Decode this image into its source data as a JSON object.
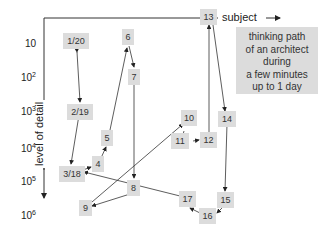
{
  "axes": {
    "x_label": "subject",
    "y_label": "level of detail",
    "y_ticks": [
      {
        "base": "10",
        "exp": ""
      },
      {
        "base": "10",
        "exp": "2"
      },
      {
        "base": "10",
        "exp": "3"
      },
      {
        "base": "10",
        "exp": "4"
      },
      {
        "base": "10",
        "exp": "5"
      },
      {
        "base": "10",
        "exp": "6"
      }
    ]
  },
  "note": {
    "line1": "thinking path",
    "line2": "of an architect",
    "line3": "during",
    "line4": "a few minutes",
    "line5": "up to 1 day"
  },
  "nodes": {
    "n1_20": "1/20",
    "n2_19": "2/19",
    "n3_18": "3/18",
    "n4": "4",
    "n5": "5",
    "n6": "6",
    "n7": "7",
    "n8": "8",
    "n9": "9",
    "n10": "10",
    "n11": "11",
    "n12": "12",
    "n13": "13",
    "n14": "14",
    "n15": "15",
    "n16": "16",
    "n17": "17"
  }
}
